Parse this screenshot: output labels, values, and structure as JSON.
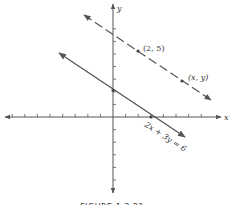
{
  "figure": {
    "caption": "FIGURE 1.3.21",
    "axes": {
      "x_label": "x",
      "y_label": "y",
      "origin_px": [
        113,
        117
      ],
      "unit_px": 12.6,
      "x_ticks": [
        -8,
        -7,
        -6,
        -5,
        -4,
        -3,
        -2,
        -1,
        1,
        2,
        3,
        4,
        5,
        6,
        7
      ],
      "y_ticks": [
        -5,
        -4,
        -3,
        -2,
        -1,
        1,
        2,
        3,
        4,
        5,
        6,
        7
      ]
    },
    "lines": [
      {
        "name": "given-line",
        "equation_label": "2x + 3y = 6",
        "style": "solid",
        "color": "#555555",
        "marked_points": [
          [
            0,
            2
          ],
          [
            3,
            0
          ]
        ]
      },
      {
        "name": "parallel-line",
        "style": "dashed",
        "color": "#555555",
        "marked_points": [
          [
            2,
            5
          ],
          [
            5.5,
            2.67
          ]
        ]
      }
    ],
    "point_labels": [
      {
        "text": "(2, 5)",
        "at": [
          2,
          5
        ]
      },
      {
        "text": "(x, y)",
        "at": [
          5.5,
          2.67
        ]
      }
    ]
  }
}
